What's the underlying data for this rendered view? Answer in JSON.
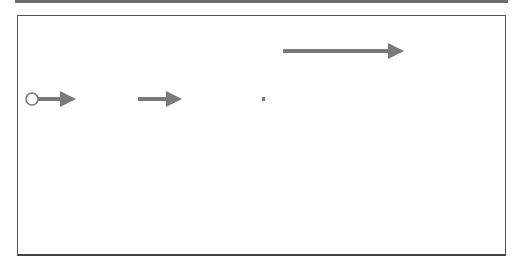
{
  "legend_header": {
    "title": "Pfeil:",
    "description": "„Ändert Status und weist zu“"
  },
  "nodes": {
    "neu": "Neu",
    "offen": "offen",
    "zugewiesen": "zugewiesen",
    "geloest": "gelöst",
    "bereit_line1": "bereit für",
    "bereit_line2": "Test",
    "geschlossen": "geschlossen",
    "fehlgeschlagen_line1": "Test fehl-",
    "fehlgeschlagen_line2": "geschlagen",
    "zurueck_line1": "zurück-",
    "zurueck_line2": "gewiesen"
  },
  "owners": {
    "tester_start": "Tester",
    "offen": "Fehler SPOC",
    "neu_line1": "Fehler",
    "neu_line2": "SPOC",
    "zugewiesen_line1": "IT Experte",
    "zugewiesen_line2": "Fachexperte",
    "geloest_line1": "Issue",
    "geloest_line2": "Manager",
    "bereit": "Tester",
    "fehlgeschlagen": "Fehler SPOC",
    "zurueck_line1": "Fehler SPOC,",
    "zurueck_line2": "Issue Manager"
  },
  "durations": {
    "start_to_neu": "< 1 Tag >",
    "neu_to_zugewiesen": "< 1 Tag >",
    "zugewiesen_to_geloest": "<… >",
    "geloest_to_bereit": "<… >",
    "bereit_to_geschlossen": "< 3 Tage >"
  },
  "start_note": {
    "line1": "Neuerfassung",
    "line2": "eines Fehlers",
    "line3": "durch Tester"
  },
  "footnote": "SPOC: Single Point of Contact",
  "legend": {
    "status": "Fehler Status",
    "owner": "Aktueller Owner eines Fehlers"
  },
  "colors": {
    "node_fill": "#8f8f8f",
    "arrow_main": "#7a7a7a",
    "arrow_thin": "#6a6a6a"
  }
}
